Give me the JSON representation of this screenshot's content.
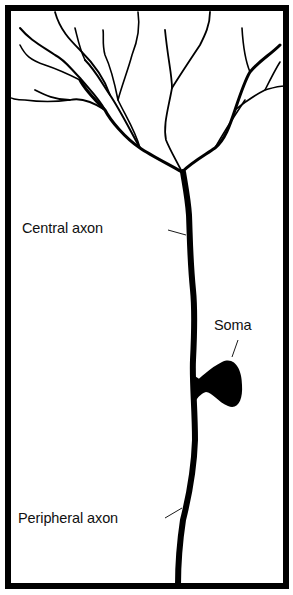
{
  "diagram": {
    "labels": {
      "central_axon": "Central axon",
      "soma": "Soma",
      "peripheral_axon": "Peripheral axon"
    },
    "colors": {
      "ink": "#000000",
      "background": "#ffffff"
    }
  }
}
